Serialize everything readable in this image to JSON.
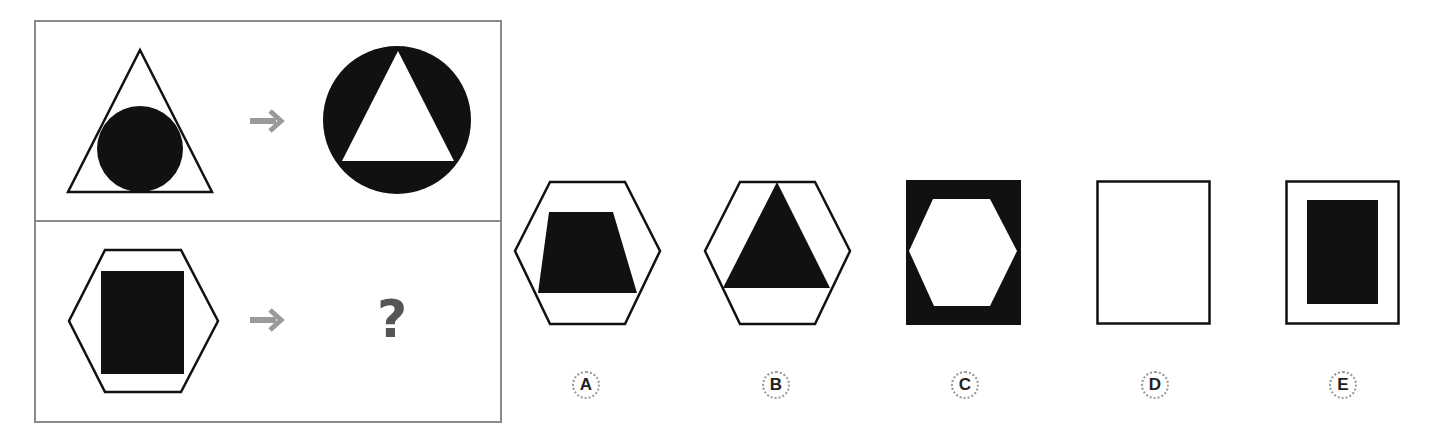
{
  "question": {
    "row1": {
      "left_figure": "triangle-outline-with-inscribed-black-circle",
      "arrow": "arrow-right",
      "right_figure": "black-circle-with-inscribed-white-triangle"
    },
    "row2": {
      "left_figure": "hexagon-outline-with-inscribed-black-rectangle",
      "arrow": "arrow-right",
      "answer_placeholder": "?"
    }
  },
  "options": [
    {
      "label": "A",
      "figure": "hexagon-outline-with-black-trapezoid"
    },
    {
      "label": "B",
      "figure": "hexagon-outline-with-black-triangle"
    },
    {
      "label": "C",
      "figure": "black-rectangle-with-white-hexagon"
    },
    {
      "label": "D",
      "figure": "empty-rectangle-outline"
    },
    {
      "label": "E",
      "figure": "rectangle-outline-with-black-rectangle"
    }
  ],
  "colors": {
    "stroke": "#111111",
    "fill": "#111111",
    "arrow": "#9a9a9a",
    "panel_border": "#8a8a8a",
    "qmark": "#555555"
  }
}
